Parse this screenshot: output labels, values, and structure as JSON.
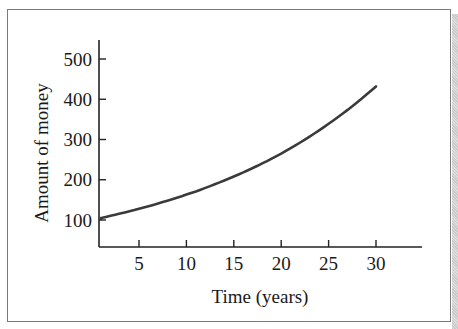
{
  "chart_data": {
    "type": "line",
    "title": "",
    "xlabel": "Time (years)",
    "ylabel": "Amount of money",
    "x_ticks": [
      5,
      10,
      15,
      20,
      25,
      30
    ],
    "y_ticks": [
      100,
      200,
      300,
      400,
      500
    ],
    "xlim": [
      0,
      35
    ],
    "ylim": [
      50,
      540
    ],
    "grid": false,
    "legend": null,
    "series": [
      {
        "name": "Amount of money",
        "x": [
          0,
          5,
          10,
          15,
          20,
          25,
          30
        ],
        "values": [
          100,
          128,
          163,
          208,
          265,
          339,
          432
        ]
      }
    ]
  },
  "colors": {
    "line": "#3a3a3a",
    "axis": "#222222",
    "frame": "#7a7a7a"
  }
}
